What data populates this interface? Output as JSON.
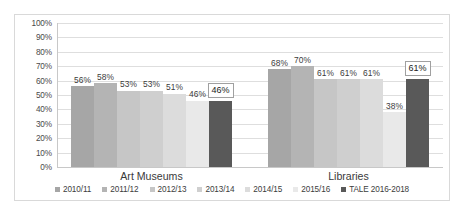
{
  "chart_data": {
    "type": "bar",
    "title": "",
    "xlabel": "",
    "ylabel": "",
    "categories": [
      "Art Museums",
      "Libraries"
    ],
    "ylim": [
      0,
      100
    ],
    "ytick_labels": [
      "100%",
      "90%",
      "80%",
      "70%",
      "60%",
      "50%",
      "40%",
      "30%",
      "20%",
      "10%",
      "0%"
    ],
    "ytick_values": [
      100,
      90,
      80,
      70,
      60,
      50,
      40,
      30,
      20,
      10,
      0
    ],
    "grid": true,
    "legend_position": "bottom",
    "value_suffix": "%",
    "series": [
      {
        "name": "2010/11",
        "color": "#a6a6a6",
        "values": [
          56,
          68
        ],
        "labels": [
          "56%",
          "68%"
        ]
      },
      {
        "name": "2011/12",
        "color": "#b4b4b4",
        "values": [
          58,
          70
        ],
        "labels": [
          "58%",
          "70%"
        ]
      },
      {
        "name": "2012/13",
        "color": "#c6c6c6",
        "values": [
          53,
          61
        ],
        "labels": [
          "53%",
          "61%"
        ]
      },
      {
        "name": "2013/14",
        "color": "#cfcfcf",
        "values": [
          53,
          61
        ],
        "labels": [
          "53%",
          "61%"
        ]
      },
      {
        "name": "2014/15",
        "color": "#dcdcdc",
        "values": [
          51,
          61
        ],
        "labels": [
          "51%",
          "61%"
        ]
      },
      {
        "name": "2015/16",
        "color": "#e9e9e9",
        "values": [
          46,
          38
        ],
        "labels": [
          "46%",
          "38%"
        ]
      },
      {
        "name": "TALE 2016-2018",
        "color": "#595959",
        "values": [
          46,
          61
        ],
        "labels": [
          "46%",
          "61%"
        ],
        "highlighted": true
      }
    ]
  }
}
